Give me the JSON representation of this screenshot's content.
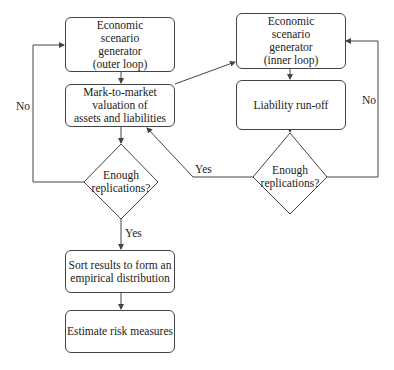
{
  "diagram": {
    "type": "flowchart",
    "nodes": {
      "outer_esg": "Economic\nscenario\ngenerator\n(outer loop)",
      "mtm_valuation": "Mark-to-market\nvaluation of\nassets and liabilities",
      "decision_outer": "Enough\nreplications?",
      "sort_results": "Sort results to form an\nempirical distribution",
      "estimate_risk": "Estimate risk measures",
      "inner_esg": "Economic\nscenario\ngenerator\n(inner loop)",
      "liability_runoff": "Liability run-off",
      "decision_inner": "Enough\nreplications?"
    },
    "edge_labels": {
      "outer_no": "No",
      "outer_yes": "Yes",
      "inner_no": "No",
      "inner_yes": "Yes"
    },
    "edges": [
      {
        "from": "outer_esg",
        "to": "mtm_valuation"
      },
      {
        "from": "mtm_valuation",
        "to": "decision_outer"
      },
      {
        "from": "mtm_valuation",
        "to": "inner_esg"
      },
      {
        "from": "inner_esg",
        "to": "liability_runoff"
      },
      {
        "from": "liability_runoff",
        "to": "decision_inner"
      },
      {
        "from": "decision_inner",
        "to": "inner_esg",
        "label": "No"
      },
      {
        "from": "decision_inner",
        "to": "mtm_valuation",
        "label": "Yes"
      },
      {
        "from": "decision_outer",
        "to": "outer_esg",
        "label": "No"
      },
      {
        "from": "decision_outer",
        "to": "sort_results",
        "label": "Yes"
      },
      {
        "from": "sort_results",
        "to": "estimate_risk"
      }
    ],
    "colors": {
      "stroke": "#444444",
      "text": "#222222",
      "background": "#ffffff"
    }
  }
}
